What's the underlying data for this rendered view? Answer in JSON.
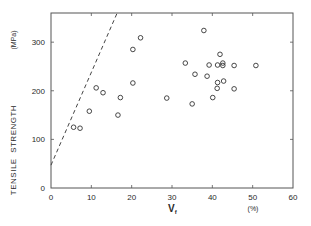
{
  "chart_data": {
    "type": "scatter",
    "title": "",
    "xlabel": "V",
    "xlabel_subscript": "f",
    "xunit": "(%)",
    "ylabel": "TENSILE  STRENGTH",
    "yunit": "(MPa)",
    "xlim": [
      0,
      60
    ],
    "ylim": [
      0,
      360
    ],
    "xticks": [
      0,
      10,
      20,
      30,
      40,
      50,
      60
    ],
    "yticks": [
      0,
      100,
      200,
      300
    ],
    "xtick_labels": [
      "0",
      "10",
      "20",
      "30",
      "40",
      "50",
      "60"
    ],
    "ytick_labels": [
      "0",
      "100",
      "200",
      "300"
    ],
    "grid": false,
    "legend": null,
    "marker": "open-circle",
    "color": "#333333",
    "points": [
      {
        "x": 5.6,
        "y": 125
      },
      {
        "x": 7.2,
        "y": 123
      },
      {
        "x": 9.5,
        "y": 158
      },
      {
        "x": 11.2,
        "y": 206
      },
      {
        "x": 12.9,
        "y": 196
      },
      {
        "x": 16.6,
        "y": 150
      },
      {
        "x": 17.2,
        "y": 186
      },
      {
        "x": 20.3,
        "y": 216
      },
      {
        "x": 20.3,
        "y": 285
      },
      {
        "x": 22.2,
        "y": 309
      },
      {
        "x": 28.7,
        "y": 185
      },
      {
        "x": 33.3,
        "y": 257
      },
      {
        "x": 35.0,
        "y": 173
      },
      {
        "x": 35.7,
        "y": 234
      },
      {
        "x": 37.9,
        "y": 324
      },
      {
        "x": 38.7,
        "y": 230
      },
      {
        "x": 39.2,
        "y": 253
      },
      {
        "x": 40.1,
        "y": 186
      },
      {
        "x": 41.3,
        "y": 253
      },
      {
        "x": 41.2,
        "y": 205
      },
      {
        "x": 41.3,
        "y": 217
      },
      {
        "x": 41.9,
        "y": 275
      },
      {
        "x": 42.6,
        "y": 257
      },
      {
        "x": 42.6,
        "y": 252
      },
      {
        "x": 42.8,
        "y": 220
      },
      {
        "x": 45.4,
        "y": 252
      },
      {
        "x": 45.4,
        "y": 204
      },
      {
        "x": 50.8,
        "y": 252
      }
    ],
    "reference_line": {
      "style": "dashed",
      "from": {
        "x": 0,
        "y": 47
      },
      "to": {
        "x": 16.4,
        "y": 360
      }
    }
  }
}
